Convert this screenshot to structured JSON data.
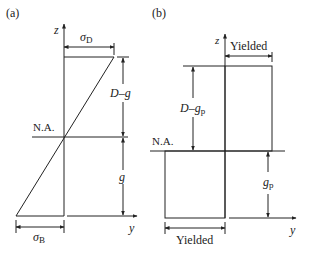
{
  "panel_a": {
    "tag": "(a)",
    "z_axis": "z",
    "y_axis": "y",
    "neutral_axis": "N.A.",
    "top_stress": {
      "sym": "σ",
      "sub": "D"
    },
    "bottom_stress": {
      "sym": "σ",
      "sub": "B"
    },
    "upper_dim": "D–g",
    "lower_dim": "g"
  },
  "panel_b": {
    "tag": "(b)",
    "z_axis": "z",
    "y_axis": "y",
    "neutral_axis": "N.A.",
    "top_label": "Yielded",
    "bottom_label": "Yielded",
    "upper_dim": {
      "text": "D–g",
      "sub": "p"
    },
    "lower_dim": {
      "text": "g",
      "sub": "p"
    }
  },
  "colors": {
    "line": "#222222",
    "background": "#ffffff"
  }
}
